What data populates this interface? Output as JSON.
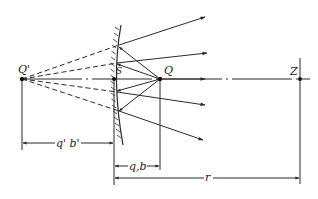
{
  "diagram": {
    "type": "optics-convex-mirror-reflection",
    "colors": {
      "line": "#2a2a2a",
      "background": "#ffffff"
    },
    "points": {
      "virtual_source": {
        "label": "Q'",
        "x": 22,
        "y": 79
      },
      "mirror_vertex": {
        "label": "S",
        "x": 114,
        "y": 79
      },
      "source": {
        "label": "Q",
        "x": 160,
        "y": 79
      },
      "observer": {
        "label": "Z",
        "x": 300,
        "y": 79
      }
    },
    "mirror": {
      "type": "convex",
      "hatched_side": "left"
    },
    "rays_count": 5,
    "dimensions": [
      {
        "label": "q' b'",
        "from": "Q'",
        "to": "S"
      },
      {
        "label": "q,b",
        "from": "S",
        "to": "Q"
      },
      {
        "label": "r",
        "from": "S",
        "to": "Z"
      }
    ]
  },
  "labels": {
    "q_prime": "Q'",
    "q": "Q",
    "s": "S",
    "z": "Z",
    "dim_qb_prime": "q' b'",
    "dim_qb": "q,b",
    "dim_r": "r"
  }
}
